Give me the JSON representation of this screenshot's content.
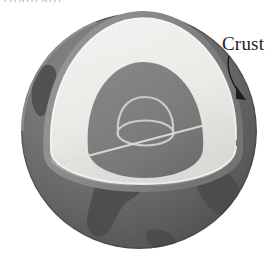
{
  "figure": {
    "background_color": "#ffffff",
    "width": 279,
    "height": 257,
    "cropped_header_text": "diagram"
  },
  "labels": {
    "crust": "Crust"
  },
  "colors": {
    "page_background": "#ffffff",
    "globe_surface": "#6f6f6f",
    "globe_surface_dark": "#5a5a5a",
    "globe_limb_light": "#9a9a9a",
    "continent": "#4b4b4b",
    "crust_band": "#8c8c8c",
    "mantle_face": "#f2f2f0",
    "mantle_face_shadow": "#e3e3e0",
    "core": "#808080",
    "core_dark": "#747474",
    "inner_core_outline": "#c9c9c4",
    "leader_line": "#1d1d1d",
    "label_text": "#1d1d1d"
  },
  "structure": {
    "layers": [
      {
        "name": "crust",
        "description": "thin outer band along cutaway arc",
        "color": "#8c8c8c"
      },
      {
        "name": "mantle",
        "description": "large pale cutaway face",
        "color": "#f2f2f0"
      },
      {
        "name": "core",
        "description": "dark gray dome inside mantle",
        "color": "#808080"
      },
      {
        "name": "inner-core",
        "description": "light outlined dome on core",
        "color": "#c9c9c4"
      }
    ]
  },
  "callout": {
    "label": "Crust",
    "has_leader_line": true,
    "has_arrowhead": true,
    "points_to": "crust"
  }
}
